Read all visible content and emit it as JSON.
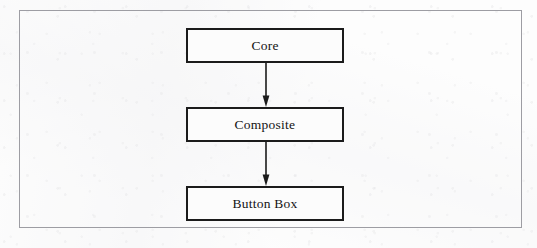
{
  "figure": {
    "kind": "class-hierarchy-diagram",
    "orientation": "vertical-top-down",
    "frame_border_color": "#9d9da3",
    "page_background_color": "#fdfdfd",
    "node_border_color": "#1b1b1b",
    "node_fill_color": "#fcfcfc",
    "text_color": "#141414",
    "arrow_color": "#1b1b1b",
    "nodes": [
      {
        "id": "core",
        "label": "Core",
        "level": 1
      },
      {
        "id": "composite",
        "label": "Composite",
        "level": 2
      },
      {
        "id": "buttonbox",
        "label": "Button Box",
        "level": 3
      }
    ],
    "edges": [
      {
        "id": "core-to-composite",
        "from": "Core",
        "to": "Composite",
        "icon": "arrow-down-icon"
      },
      {
        "id": "composite-to-buttonbox",
        "from": "Composite",
        "to": "Button Box",
        "icon": "arrow-down-icon"
      }
    ]
  }
}
